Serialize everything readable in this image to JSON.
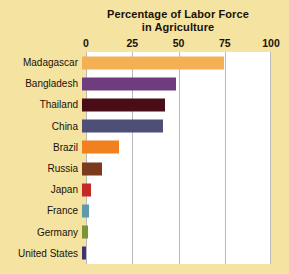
{
  "chart_data": {
    "type": "bar",
    "orientation": "horizontal",
    "title": "Percentage of Labor Force in Agriculture",
    "title_line1": "Percentage of Labor Force",
    "title_line2": "in Agriculture",
    "xlabel": "",
    "ylabel": "",
    "xlim": [
      0,
      100
    ],
    "ticks": [
      "0",
      "25",
      "50",
      "75",
      "100"
    ],
    "tick_values": [
      0,
      25,
      50,
      75,
      100
    ],
    "grid": true,
    "legend": "none",
    "categories": [
      "Madagascar",
      "Bangladesh",
      "Thailand",
      "China",
      "Brazil",
      "Russia",
      "Japan",
      "France",
      "Germany",
      "United States"
    ],
    "values": [
      77,
      51,
      45,
      44,
      20,
      11,
      5,
      4,
      3,
      2
    ],
    "bar_colors": [
      "#f5b054",
      "#6f3d7d",
      "#490d18",
      "#4d4f76",
      "#f1801e",
      "#7b3a1d",
      "#c42a25",
      "#5e9aa8",
      "#7d9433",
      "#3d3470"
    ]
  },
  "style": {
    "page_background": "#f4e3a1",
    "plot_background": "#ffffff",
    "gridline_color": "#b9b9bd",
    "text_color": "#1a1208"
  }
}
